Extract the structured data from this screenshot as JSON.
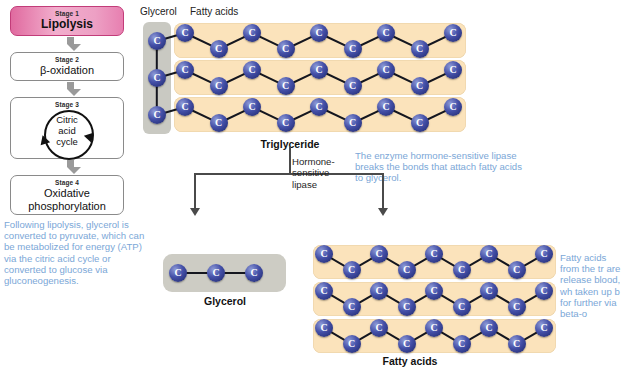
{
  "pathway": {
    "stages": [
      {
        "stage": "Stage 1",
        "title": "Lipolysis",
        "highlight": "#e06a9f"
      },
      {
        "stage": "Stage 2",
        "title": "β-oxidation"
      },
      {
        "stage": "Stage 3",
        "title": "Citric acid cycle"
      },
      {
        "stage": "Stage 4",
        "title": "Oxidative phosphorylation"
      }
    ],
    "cycle_lines": [
      "Citric",
      "acid",
      "cycle"
    ]
  },
  "headers": {
    "glycerol": "Glycerol",
    "fatty_acids": "Fatty acids"
  },
  "labels": {
    "triglyceride": "Triglyceride",
    "glycerol_product": "Glycerol",
    "fatty_acids_product": "Fatty acids",
    "enzyme": "Hormone-sensitive lipase"
  },
  "notes": {
    "left": "Following lipolysis, glycerol is converted to pyruvate, which can be metabolized for energy (ATP) via the citric acid cycle or converted to glucose via gluconeogenesis.",
    "middle": "The enzyme hormone-sensitive lipase breaks the bonds that attach fatty acids to glycerol.",
    "right": "Fatty acids from the tr are release blood, wh taken up b for further via beta-o"
  },
  "molecule": {
    "carbon_symbol": "C",
    "triglyceride_glycerol_carbons": 3,
    "fatty_acid_chain_count": 3,
    "carbons_per_chain": 9,
    "glycerol_product_carbons": 3
  },
  "colors": {
    "carbon": "#3b46a0",
    "fatty_acid_box": "#fbe3bb",
    "glycerol_box": "#c9c9c2",
    "note_text": "#7ba7d7",
    "stage1": "#e06a9f"
  }
}
